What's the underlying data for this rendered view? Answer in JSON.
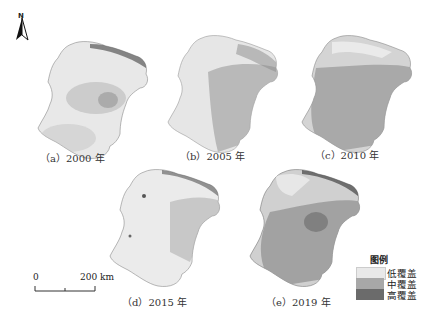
{
  "figure": {
    "panels": [
      {
        "id": "a",
        "caption": "（a）2000 年",
        "base": "#e8e8e8",
        "mid": "#bdbdbd",
        "high": "#6e6e6e",
        "mid_opacity": 0.45,
        "high_opacity": 0.35
      },
      {
        "id": "b",
        "caption": "（b）2005 年",
        "base": "#e6e6e6",
        "mid": "#a9a9a9",
        "high": "#7a7a7a",
        "mid_opacity": 0.75,
        "high_opacity": 0.2
      },
      {
        "id": "c",
        "caption": "（c）2010 年",
        "base": "#d4d4d4",
        "mid": "#9e9e9e",
        "high": "#777777",
        "mid_opacity": 0.85,
        "high_opacity": 0.3
      },
      {
        "id": "d",
        "caption": "（d）2015 年",
        "base": "#ebebeb",
        "mid": "#b5b5b5",
        "high": "#6a6a6a",
        "mid_opacity": 0.5,
        "high_opacity": 0.25
      },
      {
        "id": "e",
        "caption": "（e）2019 年",
        "base": "#d0d0d0",
        "mid": "#9a9a9a",
        "high": "#5e5e5e",
        "mid_opacity": 0.85,
        "high_opacity": 0.45
      }
    ],
    "north_arrow": {
      "label": "N"
    },
    "scale_bar": {
      "start_label": "0",
      "end_label": "200 km"
    },
    "legend": {
      "title": "图例",
      "items": [
        {
          "label": "低覆盖",
          "color": "#e9e9e9"
        },
        {
          "label": "中覆盖",
          "color": "#a8a8a8"
        },
        {
          "label": "高覆盖",
          "color": "#6b6b6b"
        }
      ]
    }
  }
}
